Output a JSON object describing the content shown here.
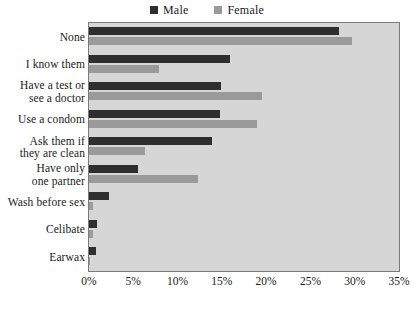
{
  "chart_data": {
    "type": "bar",
    "orientation": "horizontal",
    "title": "",
    "xlabel": "",
    "ylabel": "",
    "xlim": [
      0,
      35
    ],
    "xticks": [
      "0%",
      "5%",
      "10%",
      "15%",
      "20%",
      "25%",
      "30%",
      "35%"
    ],
    "xtick_values": [
      0,
      5,
      10,
      15,
      20,
      25,
      30,
      35
    ],
    "grid": false,
    "legend_position": "top-center",
    "categories": [
      "None",
      "I know them",
      "Have a test or see a doctor",
      "Use a condom",
      "Ask them if they are clean",
      "Have only one partner",
      "Wash before sex",
      "Celibate",
      "Earwax"
    ],
    "category_lines": [
      [
        "None"
      ],
      [
        "I know them"
      ],
      [
        "Have a test or",
        "see a doctor"
      ],
      [
        "Use a condom"
      ],
      [
        "Ask them if",
        "they are clean"
      ],
      [
        "Have only",
        "one partner"
      ],
      [
        "Wash before sex"
      ],
      [
        "Celibate"
      ],
      [
        "Earwax"
      ]
    ],
    "series": [
      {
        "name": "Male",
        "color": "#2e2e2e",
        "values": [
          28.2,
          15.9,
          14.9,
          14.8,
          13.9,
          5.5,
          2.3,
          0.9,
          0.8
        ]
      },
      {
        "name": "Female",
        "color": "#9a9a9a",
        "values": [
          29.7,
          7.9,
          19.5,
          19.0,
          6.3,
          12.3,
          0.5,
          0.4,
          0.1
        ]
      }
    ]
  },
  "legend": {
    "entries": [
      {
        "label": "Male",
        "color": "#2e2e2e"
      },
      {
        "label": "Female",
        "color": "#9a9a9a"
      }
    ]
  },
  "plot": {
    "background_color": "#d6d6d6",
    "border_color": "#7a7a7a"
  },
  "footer": {
    "fragment": ""
  }
}
